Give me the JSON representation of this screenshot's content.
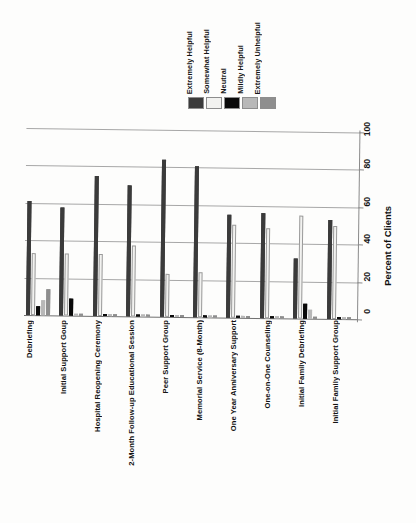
{
  "chart_data": {
    "type": "bar",
    "title": "",
    "xlabel": "",
    "ylabel": "Percent of Clients",
    "ylim": [
      0,
      100
    ],
    "yticks": [
      0,
      20,
      40,
      60,
      80,
      100
    ],
    "grid": true,
    "orientation": "rotated-90-ccw",
    "legend_position": "top-center",
    "categories": [
      "Debriefing",
      "Initial Support Goup",
      "Hospital Reopening Ceremony",
      "2-Month Follow-up Educational Session",
      "Peer Support Group",
      "Memorial Service (8-Month)",
      "One Year Anniversary Support",
      "One-on-One Counseling",
      "Initial Family Debriefing",
      "Initial Family Support Group"
    ],
    "series": [
      {
        "name": "Extremely Helpful",
        "color": "#3b3b3b",
        "values": [
          61,
          58,
          75,
          70,
          84,
          81,
          55,
          56,
          32,
          53
        ]
      },
      {
        "name": "Somewhat Helpful",
        "color": "#f2f2f0",
        "values": [
          33,
          33,
          33,
          38,
          23,
          24,
          50,
          48,
          55,
          50
        ]
      },
      {
        "name": "Neutral",
        "color": "#0a0a0a",
        "values": [
          5,
          9,
          1,
          1,
          1,
          1,
          1,
          1,
          8,
          1
        ]
      },
      {
        "name": "Mildly Helpful",
        "color": "#b8b8b8",
        "values": [
          8,
          1,
          1,
          1,
          1,
          1,
          1,
          1,
          5,
          1
        ]
      },
      {
        "name": "Extremely Unhelpful",
        "color": "#8e8e8e",
        "values": [
          14,
          1,
          1,
          1,
          1,
          1,
          1,
          1,
          1,
          1
        ]
      }
    ]
  },
  "legend": {
    "items": [
      {
        "label": "Extremely Helpful",
        "color": "#3b3b3b"
      },
      {
        "label": "Somewhat Helpful",
        "color": "#f2f2f0"
      },
      {
        "label": "Neutral",
        "color": "#0a0a0a"
      },
      {
        "label": "Mildly Helpful",
        "color": "#b8b8b8"
      },
      {
        "label": "Extremely Unhelpful",
        "color": "#8e8e8e"
      }
    ]
  },
  "axis": {
    "y_label": "Percent of Clients",
    "y_ticks": [
      "0",
      "20",
      "40",
      "60",
      "80",
      "100"
    ]
  }
}
